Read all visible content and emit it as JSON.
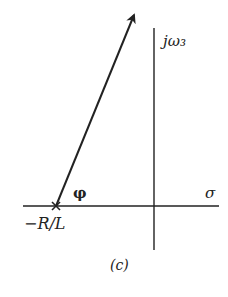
{
  "figure": {
    "caption": "(c)",
    "vertical_axis_label": "jω₃",
    "horizontal_axis_label": "σ",
    "pole_label": "−R/L",
    "angle_label": "φ",
    "colors": {
      "ink": "#222222",
      "background": "#ffffff"
    }
  },
  "elements": {
    "horizontal_axis": {
      "x1": 23,
      "y1": 206,
      "x2": 219,
      "y2": 206
    },
    "vertical_axis": {
      "x1": 154,
      "y1": 28,
      "x2": 154,
      "y2": 250
    },
    "pole_marker": {
      "x": 56,
      "y": 206,
      "symbol": "×"
    },
    "vector_arrow": {
      "x1": 56,
      "y1": 206,
      "x2": 135,
      "y2": 12
    }
  }
}
